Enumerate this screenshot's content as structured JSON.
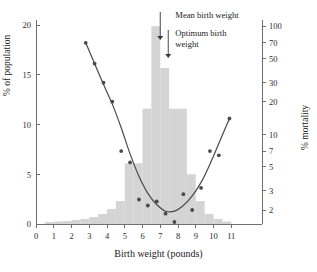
{
  "chart_data": {
    "type": "bar",
    "title": "",
    "xlabel": "Birth weight (pounds)",
    "ylabel": "% of population",
    "y2label": "% mortality",
    "xlim": [
      0,
      11.6
    ],
    "ylim": [
      0,
      21
    ],
    "y2lim": [
      1.6,
      110
    ],
    "y2_scale": "log",
    "grid": false,
    "legend": "none",
    "x_ticks": [
      "0",
      "1",
      "2",
      "3",
      "4",
      "5",
      "6",
      "7",
      "8",
      "9",
      "10",
      "11"
    ],
    "x_tick_values": [
      0,
      1,
      2,
      3,
      4,
      5,
      6,
      7,
      8,
      9,
      10,
      11
    ],
    "y_ticks": [
      "0",
      "5",
      "10",
      "15",
      "20"
    ],
    "y_tick_values": [
      0,
      5,
      10,
      15,
      20
    ],
    "y2_ticks": [
      "2",
      "3",
      "5",
      "7",
      "10",
      "20",
      "30",
      "50",
      "70",
      "100"
    ],
    "y2_tick_values": [
      2,
      3,
      5,
      7,
      10,
      20,
      30,
      50,
      70,
      100
    ],
    "series": [
      {
        "name": "% of population",
        "type": "bar",
        "axis": "left",
        "color": "#d4d4d4",
        "bin_width": 0.5,
        "bin_starts": [
          0.5,
          1.0,
          1.5,
          2.0,
          2.5,
          3.0,
          3.5,
          4.0,
          4.5,
          5.0,
          5.5,
          6.0,
          6.5,
          7.0,
          7.5,
          8.0,
          8.5,
          9.0,
          9.5,
          10.0,
          10.5
        ],
        "values": [
          0.2,
          0.25,
          0.3,
          0.4,
          0.5,
          0.7,
          1.0,
          1.5,
          2.3,
          6.1,
          6.1,
          11.6,
          19.9,
          15.7,
          11.6,
          11.6,
          5.0,
          2.3,
          1.0,
          0.5,
          0.25
        ]
      },
      {
        "name": "% mortality",
        "type": "scatter",
        "axis": "right",
        "color": "#4a4a4a",
        "x": [
          2.8,
          3.3,
          3.8,
          4.3,
          4.8,
          5.3,
          5.8,
          6.3,
          6.8,
          7.3,
          7.8,
          8.3,
          8.8,
          9.3,
          9.8,
          10.3,
          10.9
        ],
        "y": [
          70,
          45,
          30,
          20,
          7.0,
          5.5,
          2.5,
          2.2,
          2.4,
          1.85,
          1.55,
          2.8,
          2.0,
          3.2,
          7.0,
          6.4,
          14
        ]
      },
      {
        "name": "fitted mortality curve",
        "type": "line",
        "axis": "right",
        "color": "#4a4a4a",
        "x": [
          2.8,
          3.3,
          3.8,
          4.3,
          4.8,
          5.3,
          5.8,
          6.3,
          6.8,
          7.3,
          7.8,
          8.3,
          8.8,
          9.3,
          9.8,
          10.4,
          10.9
        ],
        "y": [
          70,
          45,
          29,
          19,
          11.5,
          6.6,
          4.1,
          2.85,
          2.25,
          1.95,
          1.95,
          2.2,
          2.7,
          3.6,
          5.3,
          9.0,
          14
        ]
      }
    ],
    "annotations": [
      {
        "name": "mean-birth-weight",
        "text": "Mean birth weight",
        "x": 7.0,
        "arrow": "down"
      },
      {
        "name": "optimum-birth-weight",
        "text": "Optimum birth weight",
        "x": 7.45,
        "arrow": "down"
      }
    ]
  },
  "labels": {
    "x_axis_title": "Birth weight (pounds)",
    "y_axis_left_title": "% of population",
    "y_axis_right_title": "% mortality",
    "annotation_mean": "Mean birth weight",
    "annotation_optimum_line1": "Optimum birth",
    "annotation_optimum_line2": "weight"
  },
  "colors": {
    "bar": "#d4d4d4",
    "curve": "#4a4a4a",
    "point": "#4a4a4a",
    "axis": "#6f6f6f",
    "text": "#1a1a1a",
    "background": "#ffffff"
  }
}
